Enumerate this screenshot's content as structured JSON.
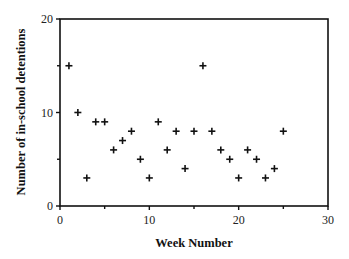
{
  "chart_data": {
    "type": "scatter",
    "title": "",
    "xlabel": "Week Number",
    "ylabel": "Number of in-school detentions",
    "xlim": [
      0,
      30
    ],
    "ylim": [
      0,
      20
    ],
    "xticks": [
      0,
      10,
      20,
      30
    ],
    "xticks_minor": [
      5,
      15,
      25
    ],
    "yticks": [
      0,
      10,
      20
    ],
    "yticks_minor": [
      5,
      15
    ],
    "xtick_labels": [
      "0",
      "10",
      "20",
      "30"
    ],
    "ytick_labels": [
      "0",
      "10",
      "20"
    ],
    "grid": false,
    "legend": null,
    "marker": "plus",
    "series": [
      {
        "name": "Detentions",
        "x": [
          1,
          2,
          3,
          4,
          5,
          6,
          7,
          8,
          9,
          10,
          11,
          12,
          13,
          14,
          15,
          16,
          17,
          18,
          19,
          20,
          21,
          22,
          23,
          24,
          25
        ],
        "y": [
          15,
          10,
          3,
          9,
          9,
          6,
          7,
          8,
          5,
          3,
          9,
          6,
          8,
          4,
          8,
          15,
          8,
          6,
          5,
          3,
          6,
          5,
          3,
          4,
          8
        ]
      }
    ]
  }
}
